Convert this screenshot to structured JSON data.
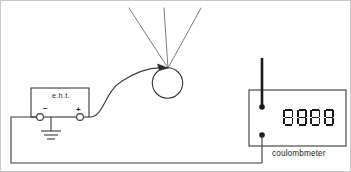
{
  "diagram": {
    "stroke_color": "#4a4a4a",
    "dark_stroke_color": "#1a1a1a",
    "background": "#ffffff",
    "border_color": "#b8b8b8"
  },
  "eht_supply": {
    "label": "e.h.t.",
    "negative_terminal_label": "−",
    "positive_terminal_label": "+",
    "earth_symbol_name": "earth-ground"
  },
  "sphere": {
    "name": "charged-metal-sphere",
    "ray_count": 3
  },
  "coulombmeter": {
    "label": "coulombmeter",
    "display_value": "8888",
    "digit_count": 4,
    "digits": [
      "8",
      "8",
      "8",
      "8"
    ],
    "segments_on": [
      "a",
      "b",
      "c",
      "d",
      "e",
      "f",
      "g"
    ],
    "probe_name": "probe-rod",
    "top_terminal_name": "top-terminal",
    "bottom_terminal_name": "bottom-terminal"
  }
}
